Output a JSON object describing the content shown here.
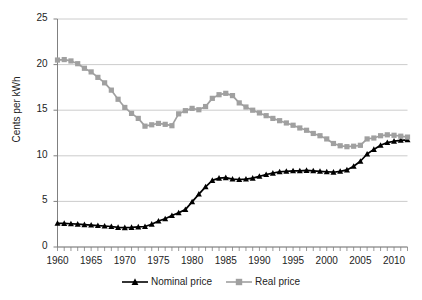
{
  "chart_data": {
    "type": "line",
    "title": "",
    "xlabel": "",
    "ylabel": "Cents per kWh",
    "xlim": [
      1960,
      2012
    ],
    "ylim": [
      0,
      25
    ],
    "ytick_step": 5,
    "xtick_step": 5,
    "minor_xtick_step": 1,
    "grid": "horizontal",
    "legend_position": "bottom-center",
    "yticks": [
      "0",
      "5",
      "10",
      "15",
      "20",
      "25"
    ],
    "xticks": [
      "1960",
      "1965",
      "1970",
      "1975",
      "1980",
      "1985",
      "1990",
      "1995",
      "2000",
      "2005",
      "2010"
    ],
    "x": [
      1960,
      1961,
      1962,
      1963,
      1964,
      1965,
      1966,
      1967,
      1968,
      1969,
      1970,
      1971,
      1972,
      1973,
      1974,
      1975,
      1976,
      1977,
      1978,
      1979,
      1980,
      1981,
      1982,
      1983,
      1984,
      1985,
      1986,
      1987,
      1988,
      1989,
      1990,
      1991,
      1992,
      1993,
      1994,
      1995,
      1996,
      1997,
      1998,
      1999,
      2000,
      2001,
      2002,
      2003,
      2004,
      2005,
      2006,
      2007,
      2008,
      2009,
      2010,
      2011,
      2012
    ],
    "series": [
      {
        "name": "Nominal price",
        "color": "#000000",
        "marker": "triangle",
        "values": [
          2.6,
          2.58,
          2.55,
          2.5,
          2.45,
          2.4,
          2.35,
          2.3,
          2.25,
          2.15,
          2.12,
          2.15,
          2.2,
          2.25,
          2.5,
          2.85,
          3.1,
          3.45,
          3.75,
          4.1,
          4.95,
          5.8,
          6.6,
          7.3,
          7.55,
          7.6,
          7.45,
          7.4,
          7.45,
          7.55,
          7.75,
          7.95,
          8.1,
          8.25,
          8.3,
          8.35,
          8.35,
          8.4,
          8.35,
          8.3,
          8.25,
          8.2,
          8.3,
          8.45,
          8.85,
          9.4,
          10.2,
          10.7,
          11.15,
          11.45,
          11.6,
          11.7,
          11.75
        ]
      },
      {
        "name": "Real price",
        "color": "#a0a0a0",
        "marker": "square",
        "values": [
          20.5,
          20.55,
          20.4,
          20.1,
          19.6,
          19.2,
          18.6,
          18.0,
          17.2,
          16.2,
          15.3,
          14.65,
          14.1,
          13.25,
          13.4,
          13.55,
          13.45,
          13.3,
          14.6,
          14.95,
          15.2,
          15.05,
          15.4,
          16.3,
          16.7,
          16.85,
          16.6,
          15.8,
          15.35,
          15.0,
          14.7,
          14.4,
          14.1,
          13.85,
          13.6,
          13.35,
          13.05,
          12.8,
          12.45,
          12.2,
          11.85,
          11.35,
          11.1,
          11.0,
          11.05,
          11.15,
          11.85,
          11.95,
          12.2,
          12.3,
          12.25,
          12.15,
          12.05
        ]
      }
    ]
  },
  "axes": {
    "ylabel_text": "Cents per kWh"
  }
}
